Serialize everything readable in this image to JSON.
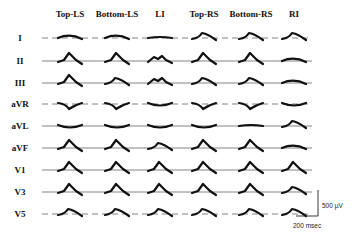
{
  "figure": {
    "columns": [
      "Top-LS",
      "Bottom-LS",
      "LI",
      "Top-RS",
      "Bottom-RS",
      "RI"
    ],
    "rows": [
      "I",
      "II",
      "III",
      "aVR",
      "aVL",
      "aVF",
      "V1",
      "V3",
      "V5"
    ],
    "scale_bar": {
      "amplitude_label": "500 µV",
      "time_label": "200 msec"
    },
    "waveform_shapes": {
      "I": [
        "flat-hump",
        "flat-hump",
        "flat",
        "hump",
        "hump",
        "hump"
      ],
      "II": [
        "peak",
        "peak",
        "double-hump",
        "peak",
        "peak",
        "flat-hump"
      ],
      "III": [
        "peak",
        "hump",
        "double-hump",
        "hump",
        "hump",
        "flat-hump"
      ],
      "aVR": [
        "dip",
        "dip",
        "flat-dip",
        "dip",
        "dip",
        "flat-dip"
      ],
      "aVL": [
        "flat-dip",
        "flat-dip",
        "flat-dip",
        "flat-dip",
        "flat",
        "hump"
      ],
      "aVF": [
        "peak",
        "peak",
        "hump",
        "peak",
        "peak",
        "flat-hump"
      ],
      "V1": [
        "peak",
        "peak",
        "peak",
        "peak",
        "peak",
        "peak"
      ],
      "V3": [
        "peak",
        "peak",
        "peak",
        "peak",
        "peak",
        "hump"
      ],
      "V5": [
        "hump",
        "hump",
        "hump",
        "hump",
        "hump",
        "hump"
      ]
    }
  }
}
